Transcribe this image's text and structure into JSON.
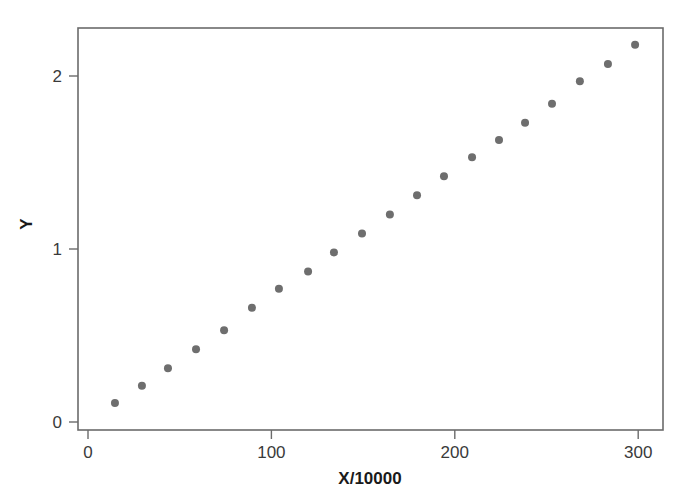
{
  "chart_data": {
    "type": "scatter",
    "title": "",
    "xlabel": "X/10000",
    "ylabel": "Y",
    "xlim": [
      0,
      312
    ],
    "ylim": [
      -0.05,
      2.29
    ],
    "xticks": [
      0,
      100,
      200,
      300
    ],
    "xtick_labels": [
      "0",
      "100",
      "200",
      "300"
    ],
    "yticks": [
      0,
      1,
      2
    ],
    "ytick_labels": [
      "0",
      "1",
      "2"
    ],
    "grid": false,
    "legend": null,
    "marker": "circle",
    "marker_color": "#6e6e6e",
    "marker_size": 7,
    "frame_color": "#6b6b6b",
    "background": "#ffffff",
    "x": [
      14.7,
      29.4,
      43.6,
      58.9,
      74.2,
      89.4,
      104.1,
      120.0,
      134.1,
      149.4,
      164.6,
      179.4,
      194.1,
      209.4,
      224.1,
      238.3,
      253.0,
      268.2,
      283.5,
      298.3
    ],
    "y": [
      0.11,
      0.21,
      0.31,
      0.42,
      0.53,
      0.66,
      0.77,
      0.87,
      0.98,
      1.09,
      1.2,
      1.31,
      1.42,
      1.53,
      1.63,
      1.73,
      1.84,
      1.97,
      2.07,
      2.18
    ]
  },
  "axes": {
    "x_title": "X/10000",
    "y_title": "Y",
    "x_tick_labels": [
      "0",
      "100",
      "200",
      "300"
    ],
    "y_tick_labels": [
      "0",
      "1",
      "2"
    ]
  }
}
